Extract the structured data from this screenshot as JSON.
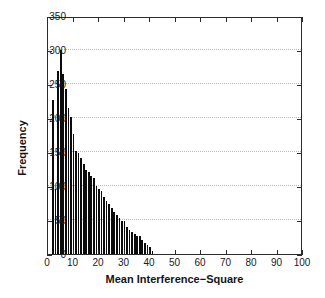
{
  "chart_data": {
    "type": "bar",
    "title": "",
    "xlabel": "Mean Interference−Square",
    "ylabel": "Frequency",
    "xlim": [
      0,
      100
    ],
    "ylim": [
      0,
      350
    ],
    "xticks": [
      0,
      10,
      20,
      30,
      40,
      50,
      60,
      70,
      80,
      90,
      100
    ],
    "yticks": [
      0,
      50,
      100,
      150,
      200,
      250,
      300,
      350
    ],
    "grid": "horizontal-dotted",
    "legend": "none",
    "bar_color": "#0b0b0b",
    "bin_width": 1,
    "x": [
      2,
      3,
      4,
      5,
      6,
      7,
      8,
      9,
      10,
      11,
      12,
      13,
      14,
      15,
      16,
      17,
      18,
      19,
      20,
      21,
      22,
      23,
      24,
      25,
      26,
      27,
      28,
      29,
      30,
      31,
      32,
      33,
      34,
      35,
      36,
      37,
      38,
      39,
      40,
      41
    ],
    "values": [
      227,
      96,
      269,
      300,
      265,
      242,
      214,
      202,
      176,
      151,
      149,
      141,
      133,
      124,
      120,
      115,
      112,
      100,
      96,
      92,
      84,
      78,
      73,
      68,
      62,
      57,
      53,
      49,
      48,
      40,
      36,
      33,
      30,
      26,
      26,
      20,
      16,
      13,
      11,
      5
    ],
    "categories": [
      "2",
      "3",
      "4",
      "5",
      "6",
      "7",
      "8",
      "9",
      "10",
      "11",
      "12",
      "13",
      "14",
      "15",
      "16",
      "17",
      "18",
      "19",
      "20",
      "21",
      "22",
      "23",
      "24",
      "25",
      "26",
      "27",
      "28",
      "29",
      "30",
      "31",
      "32",
      "33",
      "34",
      "35",
      "36",
      "37",
      "38",
      "39",
      "40",
      "41"
    ],
    "peak": {
      "x": 5,
      "value": 300
    },
    "distribution": "right-skewed"
  },
  "axes": {
    "y_axis_title": "Frequency",
    "x_axis_title": "Mean Interference−Square"
  }
}
